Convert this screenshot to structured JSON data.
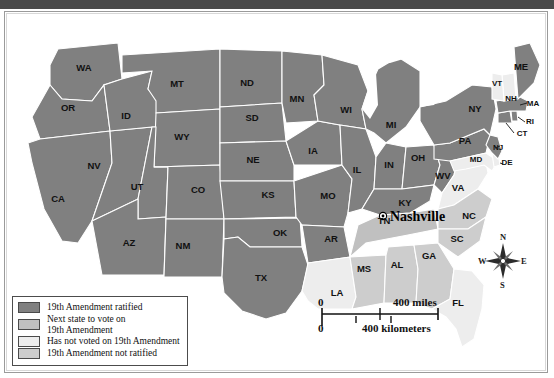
{
  "figure": {
    "city_marker": {
      "label": "Nashville"
    }
  },
  "legend": {
    "items": [
      {
        "label": "19th Amendment ratified",
        "color": "#808080",
        "key": "ratified"
      },
      {
        "label": "Next state to vote on\n19th Amendment",
        "color": "#c0c0c0",
        "key": "next"
      },
      {
        "label": "Has not voted on 19th Amendment",
        "color": "#ededed",
        "key": "not_voted"
      },
      {
        "label": "19th Amendment not ratified",
        "color": "#cdcdcd",
        "key": "not_ratified"
      }
    ]
  },
  "scale": {
    "zero_top": "0",
    "miles": "400 miles",
    "zero_bottom": "0",
    "kilometers": "400 kilometers"
  },
  "compass": {
    "north": "N",
    "south": "S",
    "east": "E",
    "west": "W"
  },
  "states": [
    {
      "abbr": "WA",
      "x": 78,
      "y": 58,
      "status": "ratified"
    },
    {
      "abbr": "OR",
      "x": 62,
      "y": 98,
      "status": "ratified"
    },
    {
      "abbr": "CA",
      "x": 52,
      "y": 189,
      "status": "ratified"
    },
    {
      "abbr": "NV",
      "x": 88,
      "y": 156,
      "status": "ratified"
    },
    {
      "abbr": "ID",
      "x": 120,
      "y": 106,
      "status": "ratified"
    },
    {
      "abbr": "MT",
      "x": 171,
      "y": 74,
      "status": "ratified"
    },
    {
      "abbr": "WY",
      "x": 176,
      "y": 127,
      "status": "ratified"
    },
    {
      "abbr": "UT",
      "x": 131,
      "y": 177,
      "status": "ratified"
    },
    {
      "abbr": "AZ",
      "x": 123,
      "y": 233,
      "status": "ratified"
    },
    {
      "abbr": "CO",
      "x": 192,
      "y": 180,
      "status": "ratified"
    },
    {
      "abbr": "NM",
      "x": 177,
      "y": 236,
      "status": "ratified"
    },
    {
      "abbr": "ND",
      "x": 241,
      "y": 73,
      "status": "ratified"
    },
    {
      "abbr": "SD",
      "x": 246,
      "y": 108,
      "status": "ratified"
    },
    {
      "abbr": "NE",
      "x": 247,
      "y": 150,
      "status": "ratified"
    },
    {
      "abbr": "KS",
      "x": 262,
      "y": 185,
      "status": "ratified"
    },
    {
      "abbr": "OK",
      "x": 274,
      "y": 223,
      "status": "ratified"
    },
    {
      "abbr": "TX",
      "x": 255,
      "y": 268,
      "status": "ratified"
    },
    {
      "abbr": "MN",
      "x": 291,
      "y": 89,
      "status": "ratified"
    },
    {
      "abbr": "IA",
      "x": 307,
      "y": 141,
      "status": "ratified"
    },
    {
      "abbr": "MO",
      "x": 322,
      "y": 186,
      "status": "ratified"
    },
    {
      "abbr": "AR",
      "x": 325,
      "y": 229,
      "status": "ratified"
    },
    {
      "abbr": "LA",
      "x": 331,
      "y": 283,
      "status": "not_voted"
    },
    {
      "abbr": "WI",
      "x": 340,
      "y": 100,
      "status": "ratified"
    },
    {
      "abbr": "IL",
      "x": 351,
      "y": 160,
      "status": "ratified"
    },
    {
      "abbr": "MS",
      "x": 358,
      "y": 259,
      "status": "not_ratified"
    },
    {
      "abbr": "MI",
      "x": 385,
      "y": 115,
      "status": "ratified"
    },
    {
      "abbr": "IN",
      "x": 383,
      "y": 155,
      "status": "ratified"
    },
    {
      "abbr": "KY",
      "x": 399,
      "y": 193,
      "status": "ratified"
    },
    {
      "abbr": "TN",
      "x": 378,
      "y": 211,
      "status": "next"
    },
    {
      "abbr": "AL",
      "x": 391,
      "y": 255,
      "status": "not_ratified"
    },
    {
      "abbr": "OH",
      "x": 412,
      "y": 148,
      "status": "ratified"
    },
    {
      "abbr": "GA",
      "x": 423,
      "y": 246,
      "status": "not_ratified"
    },
    {
      "abbr": "FL",
      "x": 452,
      "y": 293,
      "status": "not_voted"
    },
    {
      "abbr": "WV",
      "x": 437,
      "y": 166,
      "status": "ratified"
    },
    {
      "abbr": "VA",
      "x": 452,
      "y": 178,
      "status": "not_voted"
    },
    {
      "abbr": "NC",
      "x": 463,
      "y": 206,
      "status": "not_ratified"
    },
    {
      "abbr": "SC",
      "x": 451,
      "y": 229,
      "status": "not_ratified"
    },
    {
      "abbr": "PA",
      "x": 459,
      "y": 131,
      "status": "ratified"
    },
    {
      "abbr": "NY",
      "x": 469,
      "y": 99,
      "status": "ratified"
    },
    {
      "abbr": "MD",
      "x": 470,
      "y": 149,
      "status": "not_voted"
    },
    {
      "abbr": "DE",
      "x": 501,
      "y": 152,
      "status": "not_voted"
    },
    {
      "abbr": "NJ",
      "x": 492,
      "y": 137,
      "status": "ratified"
    },
    {
      "abbr": "CT",
      "x": 516,
      "y": 123,
      "status": "ratified"
    },
    {
      "abbr": "RI",
      "x": 524,
      "y": 111,
      "status": "ratified"
    },
    {
      "abbr": "MA",
      "x": 527,
      "y": 93,
      "status": "ratified"
    },
    {
      "abbr": "NH",
      "x": 505,
      "y": 88,
      "status": "not_voted"
    },
    {
      "abbr": "VT",
      "x": 491,
      "y": 73,
      "status": "not_voted"
    },
    {
      "abbr": "ME",
      "x": 515,
      "y": 57,
      "status": "ratified"
    }
  ]
}
